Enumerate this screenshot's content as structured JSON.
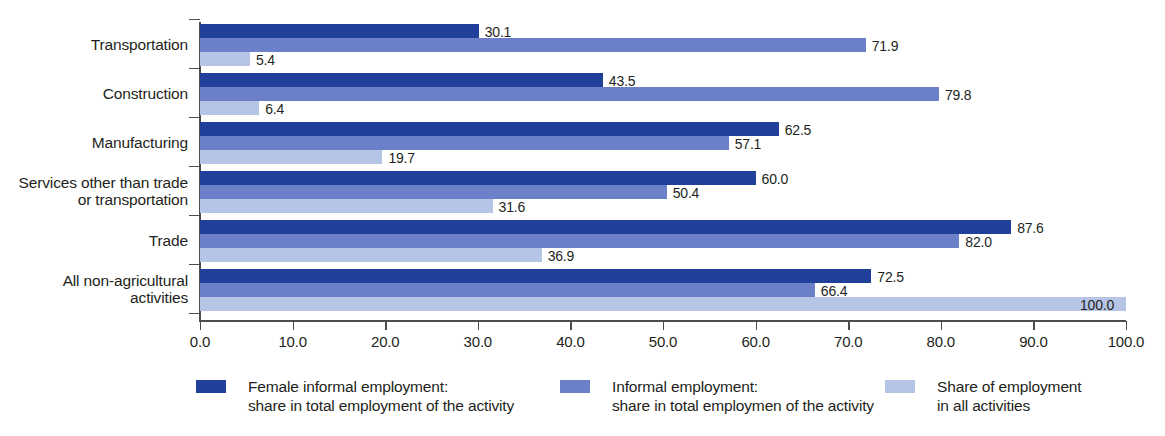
{
  "chart_data": {
    "type": "bar",
    "orientation": "horizontal",
    "title": "",
    "xlabel": "",
    "ylabel": "",
    "xlim": [
      0.0,
      100.0
    ],
    "xticks": [
      "0.0",
      "10.0",
      "20.0",
      "30.0",
      "40.0",
      "50.0",
      "60.0",
      "70.0",
      "80.0",
      "90.0",
      "100.0"
    ],
    "grid": false,
    "legend_position": "bottom",
    "categories": [
      "Transportation",
      "Construction",
      "Manufacturing",
      "Services other than trade\nor transportation",
      "Trade",
      "All non-agricultural\nactivities"
    ],
    "series": [
      {
        "name": "Female informal employment:\nshare in total employment of the activity",
        "color": "#21409a",
        "values": [
          30.1,
          43.5,
          62.5,
          60.0,
          87.6,
          72.5
        ],
        "labels": [
          "30.1",
          "43.5",
          "62.5",
          "60.0",
          "87.6",
          "72.5"
        ]
      },
      {
        "name": "Informal employment:\nshare in total employmen of the activity",
        "color": "#6b80c8",
        "values": [
          71.9,
          79.8,
          57.1,
          50.4,
          82.0,
          66.4
        ],
        "labels": [
          "71.9",
          "79.8",
          "57.1",
          "50.4",
          "82.0",
          "66.4"
        ]
      },
      {
        "name": "Share of employment\nin all activities",
        "color": "#b6c4e6",
        "values": [
          5.4,
          6.4,
          19.7,
          31.6,
          36.9,
          100.0
        ],
        "labels": [
          "5.4",
          "6.4",
          "19.7",
          "31.6",
          "36.9",
          "100.0"
        ]
      }
    ]
  },
  "legend": {
    "items": [
      {
        "label": "Female informal employment:\nshare in total employment of the activity",
        "color": "#21409a"
      },
      {
        "label": "Informal employment:\nshare in total employmen of the activity",
        "color": "#6b80c8"
      },
      {
        "label": "Share of employment\nin all activities",
        "color": "#b6c4e6"
      }
    ]
  }
}
